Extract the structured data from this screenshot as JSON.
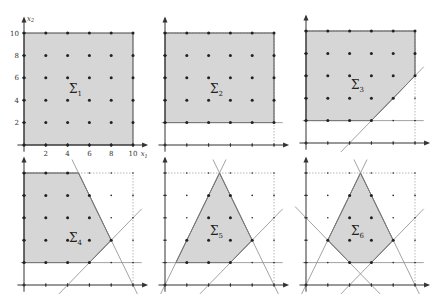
{
  "figure": {
    "colors": {
      "fill": "#d6d6d6",
      "edge": "#444444",
      "axis": "#333333",
      "cut_line": "#8a8a8a",
      "dashed": "#9a9a9a",
      "point": "#222222"
    },
    "x_axis_label": "x1",
    "y_axis_label": "x2",
    "x_ticks": [
      "2",
      "4",
      "6",
      "8",
      "10"
    ],
    "y_ticks": [
      "2",
      "4",
      "6",
      "8",
      "10"
    ],
    "panels": [
      {
        "id": 1,
        "label": "Σ",
        "sub": "1",
        "origin": [
          24,
          145
        ],
        "label_pos": [
          4.5,
          5
        ],
        "polygon": [
          [
            0,
            0
          ],
          [
            10,
            0
          ],
          [
            10,
            10
          ],
          [
            0,
            10
          ]
        ],
        "cuts": [],
        "show_ticks_labels": true
      },
      {
        "id": 2,
        "label": "Σ",
        "sub": "2",
        "origin": [
          165,
          145
        ],
        "label_pos": [
          4.5,
          5
        ],
        "polygon": [
          [
            0,
            2
          ],
          [
            10,
            2
          ],
          [
            10,
            10
          ],
          [
            0,
            10
          ]
        ],
        "cuts": [
          [
            [
              -0.3,
              2
            ],
            [
              10.8,
              2
            ]
          ]
        ],
        "show_ticks_labels": false
      },
      {
        "id": 3,
        "label": "Σ",
        "sub": "3",
        "origin": [
          306,
          143
        ],
        "label_pos": [
          4.5,
          5.2
        ],
        "polygon": [
          [
            0,
            2
          ],
          [
            6,
            2
          ],
          [
            10,
            6
          ],
          [
            10,
            10
          ],
          [
            0,
            10
          ]
        ],
        "cuts": [
          [
            [
              -0.3,
              2
            ],
            [
              10.8,
              2
            ]
          ],
          [
            [
              3.2,
              -0.8
            ],
            [
              10.8,
              6.8
            ]
          ]
        ],
        "show_ticks_labels": false
      },
      {
        "id": 4,
        "label": "Σ",
        "sub": "4",
        "origin": [
          24,
          285
        ],
        "label_pos": [
          4.5,
          4.2
        ],
        "polygon": [
          [
            0,
            2
          ],
          [
            6,
            2
          ],
          [
            8,
            4
          ],
          [
            5,
            10
          ],
          [
            0,
            10
          ]
        ],
        "cuts": [
          [
            [
              -0.3,
              2
            ],
            [
              10.8,
              2
            ]
          ],
          [
            [
              3.2,
              -0.8
            ],
            [
              10.8,
              6.8
            ]
          ],
          [
            [
              4.4,
              11.2
            ],
            [
              10.4,
              -0.8
            ]
          ]
        ],
        "show_ticks_labels": false
      },
      {
        "id": 5,
        "label": "Σ",
        "sub": "5",
        "origin": [
          165,
          285
        ],
        "label_pos": [
          4.5,
          4.8
        ],
        "polygon": [
          [
            1,
            2
          ],
          [
            6,
            2
          ],
          [
            8,
            4
          ],
          [
            5,
            10
          ]
        ],
        "cuts": [
          [
            [
              -0.3,
              2
            ],
            [
              10.8,
              2
            ]
          ],
          [
            [
              3.2,
              -0.8
            ],
            [
              10.8,
              6.8
            ]
          ],
          [
            [
              4.4,
              11.2
            ],
            [
              10.4,
              -0.8
            ]
          ],
          [
            [
              -0.4,
              -0.8
            ],
            [
              5.6,
              11.2
            ]
          ]
        ],
        "show_ticks_labels": false
      },
      {
        "id": 6,
        "label": "Σ",
        "sub": "6",
        "origin": [
          306,
          285
        ],
        "label_pos": [
          4.5,
          4.8
        ],
        "polygon": [
          [
            2,
            4
          ],
          [
            4,
            2
          ],
          [
            6,
            2
          ],
          [
            8,
            4
          ],
          [
            5,
            10
          ]
        ],
        "cuts": [
          [
            [
              -0.3,
              2
            ],
            [
              10.8,
              2
            ]
          ],
          [
            [
              3.2,
              -0.8
            ],
            [
              10.8,
              6.8
            ]
          ],
          [
            [
              4.4,
              11.2
            ],
            [
              10.4,
              -0.8
            ]
          ],
          [
            [
              -0.4,
              -0.8
            ],
            [
              5.6,
              11.2
            ]
          ],
          [
            [
              -1,
              7
            ],
            [
              6.8,
              -0.8
            ]
          ]
        ],
        "show_ticks_labels": false
      }
    ]
  }
}
